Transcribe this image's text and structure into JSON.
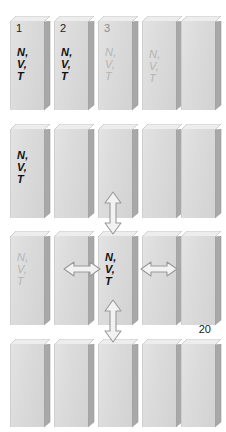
{
  "figure": {
    "name": "canonical-ensemble-grid",
    "columns": 5,
    "rows": 4,
    "colors": {
      "box_face_light": "#e3e3e3",
      "box_face_dark": "#d2d2d2",
      "box_top": "#ededed",
      "box_side": "#a8a8a8",
      "label_bold": "#111111",
      "label_faded": "#b4b4b4",
      "arrow_fill": "#f2f2f2",
      "arrow_stroke": "#9a9a9a",
      "background": "#ffffff"
    },
    "labels": {
      "nvt_lines": [
        "N,",
        "V,",
        "T"
      ],
      "cell_1": "1",
      "cell_2": "2",
      "cell_3": "3",
      "cell_20": "20"
    },
    "rows_data": [
      {
        "row_name": "ensemble-row-1",
        "cells": [
          {
            "name": "cell-1",
            "index": "1",
            "nvt": "bold",
            "count": null
          },
          {
            "name": "cell-2",
            "index": "2",
            "nvt": "bold",
            "count": null
          },
          {
            "name": "cell-3",
            "index": "3",
            "nvt": "faded",
            "count": null
          },
          {
            "name": "cell-4",
            "index": null,
            "nvt": "faded",
            "count": null
          },
          {
            "name": "cell-5",
            "index": null,
            "nvt": "none",
            "count": null
          }
        ]
      },
      {
        "row_name": "ensemble-row-2",
        "cells": [
          {
            "name": "cell-6",
            "index": null,
            "nvt": "bold",
            "count": null
          },
          {
            "name": "cell-7",
            "index": null,
            "nvt": "none",
            "count": null
          },
          {
            "name": "cell-8",
            "index": null,
            "nvt": "none",
            "count": null
          },
          {
            "name": "cell-9",
            "index": null,
            "nvt": "none",
            "count": null
          },
          {
            "name": "cell-10",
            "index": null,
            "nvt": "none",
            "count": null
          }
        ]
      },
      {
        "row_name": "ensemble-row-3",
        "cells": [
          {
            "name": "cell-11",
            "index": null,
            "nvt": "faded",
            "count": null
          },
          {
            "name": "cell-12",
            "index": null,
            "nvt": "none",
            "count": null
          },
          {
            "name": "cell-13",
            "index": null,
            "nvt": "bold",
            "count": null
          },
          {
            "name": "cell-14",
            "index": null,
            "nvt": "none",
            "count": null
          },
          {
            "name": "cell-15",
            "index": null,
            "nvt": "none",
            "count": null
          }
        ]
      },
      {
        "row_name": "ensemble-row-4",
        "cells": [
          {
            "name": "cell-16",
            "index": null,
            "nvt": "none",
            "count": null
          },
          {
            "name": "cell-17",
            "index": null,
            "nvt": "none",
            "count": null
          },
          {
            "name": "cell-18",
            "index": null,
            "nvt": "none",
            "count": null
          },
          {
            "name": "cell-19",
            "index": null,
            "nvt": "none",
            "count": null
          },
          {
            "name": "cell-20",
            "index": null,
            "nvt": "none",
            "count": "20"
          }
        ]
      }
    ],
    "arrows": [
      {
        "name": "arrow-vertical-upper",
        "direction": "vertical",
        "between": "row-2 and row-3",
        "column": 3
      },
      {
        "name": "arrow-vertical-lower",
        "direction": "vertical",
        "between": "row-3 and row-4",
        "column": 3
      },
      {
        "name": "arrow-horizontal-left",
        "direction": "horizontal",
        "between": "cell-12 and cell-13",
        "column": 2
      },
      {
        "name": "arrow-horizontal-right",
        "direction": "horizontal",
        "between": "cell-13 and cell-14",
        "column": 4
      }
    ]
  }
}
